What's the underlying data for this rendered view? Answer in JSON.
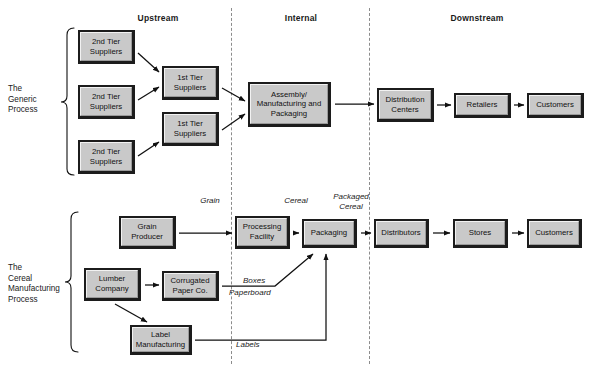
{
  "diagram": {
    "width": 591,
    "height": 370,
    "colors": {
      "box_fill": "#c9c9c9",
      "box_border": "#1c1c1c",
      "divider": "#8c8c8c",
      "text": "#111111",
      "background": "#ffffff"
    }
  },
  "column_headers": [
    {
      "label": "Upstream",
      "x": 158
    },
    {
      "label": "Internal",
      "x": 301
    },
    {
      "label": "Downstream",
      "x": 477
    }
  ],
  "dividers": [
    {
      "name": "upstream-internal-divider",
      "x": 231
    },
    {
      "name": "internal-downstream-divider",
      "x": 369
    }
  ],
  "row_labels": [
    {
      "name": "generic-process-label",
      "text": "The\nGeneric\nProcess",
      "x": 8,
      "y": 84
    },
    {
      "name": "cereal-process-label",
      "text": "The\nCereal\nManufacturing\nProcess",
      "x": 8,
      "y": 263
    }
  ],
  "generic_process": {
    "name": "The Generic Process",
    "nodes": [
      {
        "id": "g-2nd-a",
        "label": "2nd Tier\nSuppliers",
        "x": 78,
        "y": 30,
        "w": 57,
        "h": 34
      },
      {
        "id": "g-2nd-b",
        "label": "2nd Tier\nSuppliers",
        "x": 78,
        "y": 85,
        "w": 57,
        "h": 34
      },
      {
        "id": "g-2nd-c",
        "label": "2nd Tier\nSuppliers",
        "x": 78,
        "y": 140,
        "w": 57,
        "h": 34
      },
      {
        "id": "g-1st-a",
        "label": "1st Tier\nSuppliers",
        "x": 162,
        "y": 66,
        "w": 57,
        "h": 34
      },
      {
        "id": "g-1st-b",
        "label": "1st Tier\nSuppliers",
        "x": 162,
        "y": 112,
        "w": 57,
        "h": 34
      },
      {
        "id": "g-asm",
        "label": "Assembly/\nManufacturing and\nPackaging",
        "x": 248,
        "y": 82,
        "w": 83,
        "h": 45
      },
      {
        "id": "g-dc",
        "label": "Distribution\nCenters",
        "x": 377,
        "y": 88,
        "w": 57,
        "h": 34
      },
      {
        "id": "g-ret",
        "label": "Retailers",
        "x": 454,
        "y": 93,
        "w": 57,
        "h": 25
      },
      {
        "id": "g-cus",
        "label": "Customers",
        "x": 527,
        "y": 93,
        "w": 57,
        "h": 25
      }
    ],
    "edges": [
      {
        "from": "g-2nd-a",
        "to": "g-1st-a"
      },
      {
        "from": "g-2nd-b",
        "to": "g-1st-a"
      },
      {
        "from": "g-2nd-c",
        "to": "g-1st-b"
      },
      {
        "from": "g-1st-a",
        "to": "g-asm"
      },
      {
        "from": "g-1st-b",
        "to": "g-asm"
      },
      {
        "from": "g-asm",
        "to": "g-dc"
      },
      {
        "from": "g-dc",
        "to": "g-ret"
      },
      {
        "from": "g-ret",
        "to": "g-cus"
      }
    ]
  },
  "cereal_process": {
    "name": "The Cereal Manufacturing Process",
    "nodes": [
      {
        "id": "c-grain",
        "label": "Grain\nProducer",
        "x": 119,
        "y": 216,
        "w": 57,
        "h": 33
      },
      {
        "id": "c-lumb",
        "label": "Lumber\nCompany",
        "x": 84,
        "y": 268,
        "w": 57,
        "h": 33
      },
      {
        "id": "c-corr",
        "label": "Corrugated\nPaper Co.",
        "x": 162,
        "y": 271,
        "w": 57,
        "h": 30
      },
      {
        "id": "c-label",
        "label": "Label\nManufacturing",
        "x": 130,
        "y": 325,
        "w": 62,
        "h": 30
      },
      {
        "id": "c-proc",
        "label": "Processing\nFacility",
        "x": 235,
        "y": 216,
        "w": 55,
        "h": 33
      },
      {
        "id": "c-pack",
        "label": "Packaging",
        "x": 302,
        "y": 219,
        "w": 55,
        "h": 29
      },
      {
        "id": "c-dist",
        "label": "Distributors",
        "x": 374,
        "y": 219,
        "w": 55,
        "h": 29
      },
      {
        "id": "c-store",
        "label": "Stores",
        "x": 453,
        "y": 219,
        "w": 55,
        "h": 29
      },
      {
        "id": "c-cust",
        "label": "Customers",
        "x": 527,
        "y": 219,
        "w": 55,
        "h": 29
      }
    ],
    "edges": [
      {
        "from": "c-grain",
        "to": "c-proc",
        "label": "Grain"
      },
      {
        "from": "c-lumb",
        "to": "c-corr",
        "label": ""
      },
      {
        "from": "c-lumb",
        "to": "c-label",
        "label": ""
      },
      {
        "from": "c-corr",
        "to": "c-pack",
        "label": "Boxes / Paperboard"
      },
      {
        "from": "c-label",
        "to": "c-pack",
        "label": "Labels"
      },
      {
        "from": "c-proc",
        "to": "c-pack",
        "label": "Cereal"
      },
      {
        "from": "c-pack",
        "to": "c-dist",
        "label": "Packaged Cereal"
      },
      {
        "from": "c-dist",
        "to": "c-store",
        "label": ""
      },
      {
        "from": "c-store",
        "to": "c-cust",
        "label": ""
      }
    ],
    "flow_notes": [
      {
        "name": "flow-note-grain",
        "text": "Grain",
        "x": 210,
        "y": 196,
        "align": "center"
      },
      {
        "name": "flow-note-cereal",
        "text": "Cereal",
        "x": 296,
        "y": 196,
        "align": "center"
      },
      {
        "name": "flow-note-packaged-cereal",
        "text": "Packaged\nCereal",
        "x": 351,
        "y": 192,
        "align": "center"
      },
      {
        "name": "flow-note-boxes",
        "text": "Boxes",
        "x": 243,
        "y": 277,
        "align": "left"
      },
      {
        "name": "flow-note-paperboard",
        "text": "Paperboard",
        "x": 229,
        "y": 289,
        "align": "left"
      },
      {
        "name": "flow-note-labels",
        "text": "Labels",
        "x": 236,
        "y": 341,
        "align": "left"
      }
    ]
  }
}
